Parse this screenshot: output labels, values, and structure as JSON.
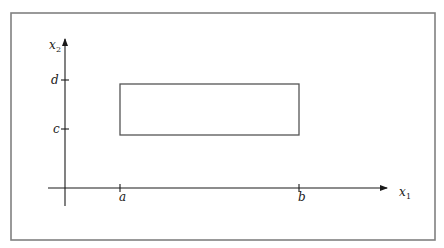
{
  "diagram": {
    "axes": {
      "x_label": "x",
      "x_label_sub": "1",
      "y_label": "x",
      "y_label_sub": "2"
    },
    "x_ticks": [
      {
        "label": "a"
      },
      {
        "label": "b"
      }
    ],
    "y_ticks": [
      {
        "label": "c"
      },
      {
        "label": "d"
      }
    ],
    "colors": {
      "frame": "#808080",
      "axis": "#1a1a1a",
      "rectangle": "#555555"
    }
  }
}
